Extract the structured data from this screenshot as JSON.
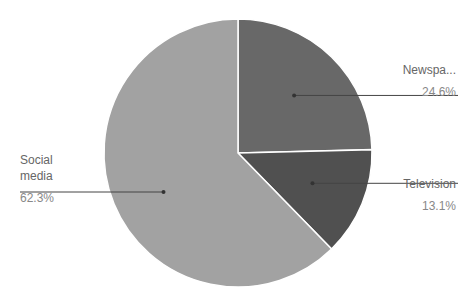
{
  "chart_data": {
    "type": "pie",
    "title": "",
    "categories": [
      "Newspaper",
      "Television",
      "Social media"
    ],
    "values": [
      24.6,
      13.1,
      62.3
    ],
    "display_labels": [
      "Newspa...",
      "Television",
      "Social media"
    ],
    "percent_labels": [
      "24.6%",
      "13.1%",
      "62.3%"
    ],
    "colors": [
      "#686868",
      "#505050",
      "#a2a2a2"
    ],
    "start_angle_deg": 0,
    "direction": "clockwise",
    "legend": "none (leader-line labels)"
  },
  "labels": {
    "newspaper": {
      "name": "Newspa...",
      "pct": "24.6%"
    },
    "television": {
      "name": "Television",
      "pct": "13.1%"
    },
    "social": {
      "name_line1": "Social",
      "name_line2": "media",
      "pct": "62.3%"
    }
  }
}
